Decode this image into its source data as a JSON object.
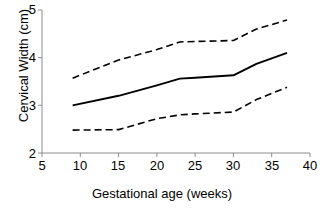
{
  "chart_data": {
    "type": "line",
    "title": "",
    "xlabel": "Gestational age (weeks)",
    "ylabel": "Cervical Width (cm)",
    "xlim": [
      5,
      40
    ],
    "ylim": [
      2,
      5
    ],
    "xticks": [
      5,
      10,
      15,
      20,
      25,
      30,
      35,
      40
    ],
    "yticks": [
      2,
      3,
      4,
      5
    ],
    "grid": false,
    "legend": "none",
    "x": [
      9,
      15,
      20,
      23,
      25,
      30,
      33,
      37
    ],
    "series": [
      {
        "name": "upper limit",
        "style": "dashed",
        "color": "#000000",
        "values": [
          3.57,
          3.95,
          4.17,
          4.33,
          4.34,
          4.36,
          4.6,
          4.79
        ]
      },
      {
        "name": "mean",
        "style": "solid",
        "color": "#000000",
        "values": [
          3.0,
          3.2,
          3.42,
          3.56,
          3.58,
          3.63,
          3.87,
          4.1
        ]
      },
      {
        "name": "lower limit",
        "style": "dashed",
        "color": "#000000",
        "values": [
          2.48,
          2.49,
          2.72,
          2.8,
          2.82,
          2.86,
          3.12,
          3.38
        ]
      }
    ]
  },
  "axes": {
    "y_title": "Cervical Width (cm)",
    "x_title": "Gestational age (weeks)",
    "y_tick_labels": [
      "5",
      "4",
      "3",
      "2"
    ],
    "x_tick_labels": [
      "5",
      "10",
      "15",
      "20",
      "25",
      "30",
      "35",
      "40"
    ]
  },
  "colors": {
    "axis": "#808080",
    "line": "#000000",
    "background": "#ffffff"
  }
}
